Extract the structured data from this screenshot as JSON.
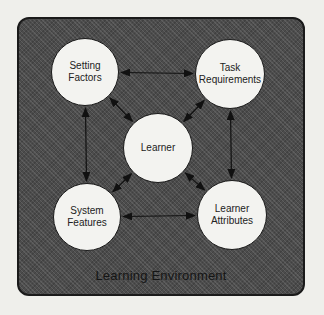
{
  "diagram": {
    "container_label": "Learning Environment",
    "colors": {
      "background": "#efefeb",
      "container_fill": "#4c4c4c",
      "node_fill": "#f3f3f0",
      "stroke": "#1a1a1a"
    },
    "nodes": [
      {
        "id": "setting-factors",
        "lines": [
          "Setting",
          "Factors"
        ],
        "cx": 85,
        "cy": 72,
        "r": 34
      },
      {
        "id": "task-requirements",
        "lines": [
          "Task",
          "Requirements"
        ],
        "cx": 230,
        "cy": 74,
        "r": 35
      },
      {
        "id": "learner",
        "lines": [
          "Learner"
        ],
        "cx": 158,
        "cy": 148,
        "r": 35
      },
      {
        "id": "system-features",
        "lines": [
          "System",
          "Features"
        ],
        "cx": 87,
        "cy": 217,
        "r": 34
      },
      {
        "id": "learner-attributes",
        "lines": [
          "Learner",
          "Attributes"
        ],
        "cx": 232,
        "cy": 215,
        "r": 35
      }
    ],
    "edges": [
      {
        "from": "setting-factors",
        "to": "task-requirements",
        "type": "bidirectional"
      },
      {
        "from": "setting-factors",
        "to": "system-features",
        "type": "bidirectional"
      },
      {
        "from": "task-requirements",
        "to": "learner-attributes",
        "type": "bidirectional"
      },
      {
        "from": "system-features",
        "to": "learner-attributes",
        "type": "bidirectional"
      },
      {
        "from": "learner",
        "to": "setting-factors",
        "type": "bidirectional"
      },
      {
        "from": "learner",
        "to": "task-requirements",
        "type": "bidirectional"
      },
      {
        "from": "learner",
        "to": "system-features",
        "type": "bidirectional"
      },
      {
        "from": "learner",
        "to": "learner-attributes",
        "type": "bidirectional"
      }
    ]
  }
}
